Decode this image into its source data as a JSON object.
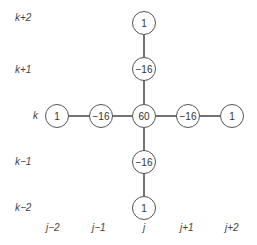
{
  "diagram": {
    "row_labels": [
      "k+2",
      "k+1",
      "k",
      "k−1",
      "k−2"
    ],
    "col_labels": [
      "j−2",
      "j−1",
      "j",
      "j+1",
      "j+2"
    ],
    "center_column": [
      {
        "row": "k+2",
        "value": "1"
      },
      {
        "row": "k+1",
        "value": "−16"
      },
      {
        "row": "k",
        "value": "60"
      },
      {
        "row": "k−1",
        "value": "−16"
      },
      {
        "row": "k−2",
        "value": "1"
      }
    ],
    "center_row": [
      {
        "col": "j−2",
        "value": "1"
      },
      {
        "col": "j−1",
        "value": "−16"
      },
      {
        "col": "j+1",
        "value": "−16"
      },
      {
        "col": "j+2",
        "value": "1"
      }
    ]
  }
}
